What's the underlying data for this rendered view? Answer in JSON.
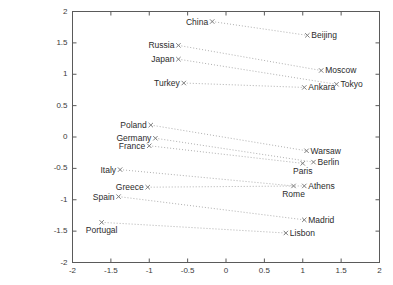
{
  "chart_data": {
    "type": "scatter",
    "title": "",
    "xlabel": "",
    "ylabel": "",
    "xlim": [
      -2,
      2
    ],
    "ylim": [
      -2,
      2
    ],
    "grid": false,
    "legend": null,
    "xticks": [
      "-2",
      "-1.5",
      "-1",
      "-0.5",
      "0",
      "0.5",
      "1",
      "1.5",
      "2"
    ],
    "xtick_values": [
      -2,
      -1.5,
      -1,
      -0.5,
      0,
      0.5,
      1,
      1.5,
      2
    ],
    "yticks": [
      "2",
      "1.5",
      "1",
      "0.5",
      "0",
      "-0.5",
      "-1",
      "-1.5",
      "-2"
    ],
    "ytick_values": [
      2,
      1.5,
      1,
      0.5,
      0,
      -0.5,
      -1,
      -1.5,
      -2
    ],
    "marker": "x",
    "marker_color": "#808080",
    "line_style": "dotted",
    "line_color": "#b0b0b0",
    "pairs": [
      {
        "country": "China",
        "capital": "Beijing",
        "country_x": -0.18,
        "country_y": 1.84,
        "capital_x": 1.06,
        "capital_y": 1.62,
        "country_label_pos": "left",
        "capital_label_pos": "right"
      },
      {
        "country": "Russia",
        "capital": "Moscow",
        "country_x": -0.62,
        "country_y": 1.46,
        "capital_x": 1.24,
        "capital_y": 1.06,
        "country_label_pos": "left",
        "capital_label_pos": "right"
      },
      {
        "country": "Japan",
        "capital": "Tokyo",
        "country_x": -0.62,
        "country_y": 1.24,
        "capital_x": 1.44,
        "capital_y": 0.84,
        "country_label_pos": "left",
        "capital_label_pos": "right"
      },
      {
        "country": "Turkey",
        "capital": "Ankara",
        "country_x": -0.55,
        "country_y": 0.86,
        "capital_x": 1.02,
        "capital_y": 0.79,
        "country_label_pos": "left",
        "capital_label_pos": "right"
      },
      {
        "country": "Poland",
        "capital": "Warsaw",
        "country_x": -0.98,
        "country_y": 0.19,
        "capital_x": 1.05,
        "capital_y": -0.22,
        "country_label_pos": "left",
        "capital_label_pos": "right"
      },
      {
        "country": "Germany",
        "capital": "Berlin",
        "country_x": -0.92,
        "country_y": -0.02,
        "capital_x": 1.14,
        "capital_y": -0.4,
        "country_label_pos": "left",
        "capital_label_pos": "right"
      },
      {
        "country": "France",
        "capital": "Paris",
        "country_x": -1.0,
        "country_y": -0.14,
        "capital_x": 1.0,
        "capital_y": -0.42,
        "country_label_pos": "left",
        "capital_label_pos": "below"
      },
      {
        "country": "Italy",
        "capital": "Rome",
        "country_x": -1.38,
        "country_y": -0.52,
        "capital_x": 0.88,
        "capital_y": -0.78,
        "country_label_pos": "left",
        "capital_label_pos": "below"
      },
      {
        "country": "Greece",
        "capital": "Athens",
        "country_x": -1.02,
        "country_y": -0.8,
        "capital_x": 1.02,
        "capital_y": -0.78,
        "country_label_pos": "left",
        "capital_label_pos": "right"
      },
      {
        "country": "Spain",
        "capital": "Madrid",
        "country_x": -1.4,
        "country_y": -0.95,
        "capital_x": 1.02,
        "capital_y": -1.32,
        "country_label_pos": "left",
        "capital_label_pos": "right"
      },
      {
        "country": "Portugal",
        "capital": "Lisbon",
        "country_x": -1.62,
        "country_y": -1.36,
        "capital_x": 0.78,
        "capital_y": -1.53,
        "country_label_pos": "below",
        "capital_label_pos": "right"
      }
    ]
  }
}
